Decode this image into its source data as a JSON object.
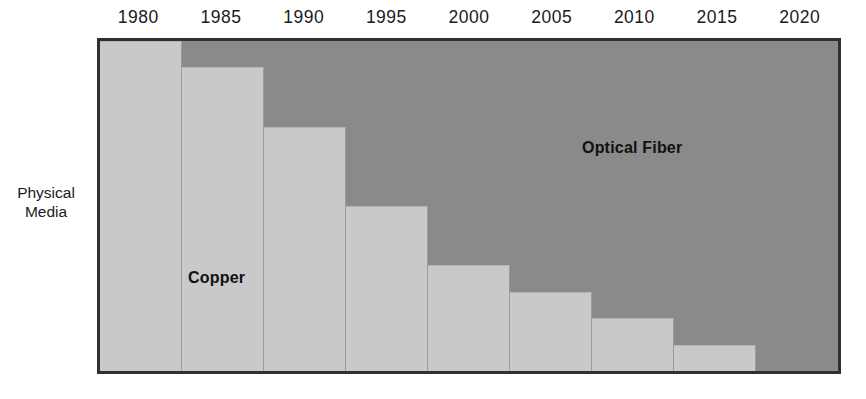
{
  "axis": {
    "y_caption_line1": "Physical",
    "y_caption_line2": "Media",
    "x_tick_labels": [
      "1980",
      "1985",
      "1990",
      "1995",
      "2000",
      "2005",
      "2010",
      "2015",
      "2020"
    ]
  },
  "labels": {
    "copper": "Copper",
    "optical_fiber": "Optical Fiber"
  },
  "colors": {
    "copper": "#c9c9c9",
    "optical_fiber": "#8a8a8a",
    "border": "#303030",
    "text": "#1b1b1b"
  },
  "chart_data": {
    "type": "bar",
    "title": "",
    "subtitle": "",
    "xlabel": "",
    "ylabel": "Physical Media",
    "ylim": [
      0,
      100
    ],
    "grid": false,
    "legend_position": "in-plot",
    "stacked": true,
    "categories": [
      "1980",
      "1985",
      "1990",
      "1995",
      "2000",
      "2005",
      "2010",
      "2015",
      "2020"
    ],
    "series": [
      {
        "name": "Copper",
        "color": "#c9c9c9",
        "values": [
          100,
          92,
          74,
          50,
          32,
          24,
          16,
          8,
          0
        ]
      },
      {
        "name": "Optical Fiber",
        "color": "#8a8a8a",
        "values": [
          0,
          8,
          26,
          50,
          68,
          76,
          84,
          92,
          100
        ]
      }
    ],
    "annotations": [
      {
        "text": "Copper",
        "category": "1985"
      },
      {
        "text": "Optical Fiber",
        "category": "2010"
      }
    ]
  }
}
